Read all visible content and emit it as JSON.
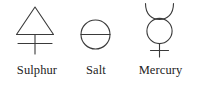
{
  "figure": {
    "background_color": "#ffffff",
    "stroke_color": "#3a3a3a",
    "text_color": "#232323",
    "width": 199,
    "height": 92
  },
  "symbols": [
    {
      "key": "sulphur",
      "label": "Sulphur",
      "icon_name": "sulphur-alchemical-symbol",
      "description": "Triangle above a cross"
    },
    {
      "key": "salt",
      "label": "Salt",
      "icon_name": "salt-alchemical-symbol",
      "description": "Circle bisected by a horizontal line"
    },
    {
      "key": "mercury",
      "label": "Mercury",
      "icon_name": "mercury-alchemical-symbol",
      "description": "Upward crescent above a circle above a cross"
    }
  ]
}
